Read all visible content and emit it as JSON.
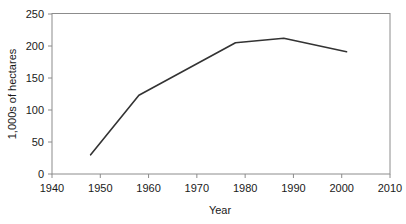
{
  "chart_data": {
    "type": "line",
    "title": "",
    "xlabel": "Year",
    "ylabel": "1,000s of hectares",
    "xlim": [
      1940,
      2010
    ],
    "ylim": [
      0,
      250
    ],
    "xticks": [
      1940,
      1950,
      1960,
      1970,
      1980,
      1990,
      2000,
      2010
    ],
    "yticks": [
      0,
      50,
      100,
      150,
      200,
      250
    ],
    "xtick_labels": [
      "1940",
      "1950",
      "1960",
      "1970",
      "1980",
      "1990",
      "2000",
      "2010"
    ],
    "ytick_labels": [
      "0",
      "50",
      "100",
      "150",
      "200",
      "250"
    ],
    "grid": false,
    "legend": false,
    "legend_position": "none",
    "series": [
      {
        "name": "Area",
        "color": "#333333",
        "x": [
          1948,
          1958,
          1978,
          1988,
          2001
        ],
        "values": [
          30,
          123,
          205,
          212,
          191
        ]
      }
    ],
    "annotations": []
  },
  "figure": {
    "background_color": "#ffffff",
    "frame_color": "#808080",
    "line_color": "#333333"
  }
}
